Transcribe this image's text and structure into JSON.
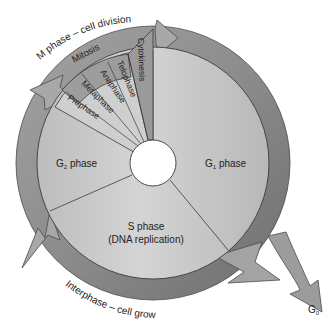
{
  "diagram": {
    "type": "cell-cycle",
    "colors": {
      "ring": "#8f8f8f",
      "ring_dark": "#6f6f6f",
      "disk": "#c4c4c4",
      "disk_light": "#d2d2d2",
      "mitosis_band": "#9a9a9a",
      "substage": "#cdcdcd",
      "stroke": "#3a3a3a",
      "arrow": "#a6a6a6",
      "text": "#222222"
    },
    "outer_labels": {
      "m_phase": "M phase – cell division",
      "interphase": "Interphase – cell growth",
      "g0": "G",
      "g0_sub": "0"
    },
    "phases": {
      "g1": {
        "main": "G",
        "sub": "1",
        "rest": " phase"
      },
      "g2": {
        "main": "G",
        "sub": "2",
        "rest": " phase"
      },
      "s": {
        "line1": "S phase",
        "line2": "(DNA replication)"
      }
    },
    "m_phase": {
      "mitosis": "Mitosis",
      "cytokinesis": "Cytokinesis",
      "stages": [
        "Prophase",
        "Metaphase",
        "Anaphase",
        "Telophase"
      ]
    }
  }
}
